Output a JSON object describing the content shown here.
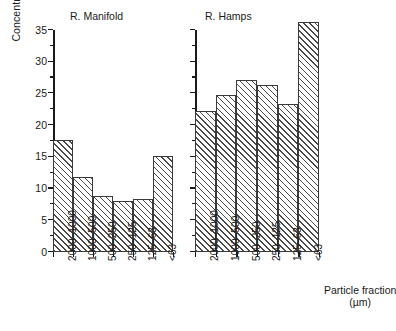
{
  "chart_data": {
    "type": "bar",
    "title": "",
    "xlabel": "Particle fraction (µm)",
    "xlabel_line1": "Particle fraction",
    "xlabel_line2": "(µm)",
    "ylabel": "Concentration of  metals (mM.kg⁻¹ )",
    "ylabel_main": "Concentration of  metals (mM.kg",
    "ylabel_sup": "−1",
    "ylabel_tail": " )",
    "categories": [
      "2000–1000",
      "1000–500",
      "500–250",
      "250–125",
      "125–63",
      "<63"
    ],
    "ylim": [
      0,
      35
    ],
    "ytick_values": [
      0,
      5,
      10,
      15,
      20,
      25,
      30,
      35
    ],
    "ytick_labels": [
      "0",
      "5",
      "10",
      "15",
      "20",
      "25",
      "30",
      "35"
    ],
    "yminor_values": [
      2.5,
      7.5,
      12.5,
      17.5,
      22.5,
      27.5,
      32.5
    ],
    "grid": false,
    "legend": "none",
    "panels": [
      {
        "name": "R. Manifold",
        "values": [
          17.7,
          11.8,
          8.9,
          8.1,
          8.4,
          15.2
        ]
      },
      {
        "name": "R. Hamps",
        "values": [
          22.3,
          24.7,
          27.1,
          26.4,
          23.4,
          36.3
        ]
      }
    ],
    "bar_fill": "#ffffff",
    "bar_edge": "#3a3a3a",
    "bar_hatch": "diagonal-forward",
    "axis_color": "#1a1a1a"
  }
}
